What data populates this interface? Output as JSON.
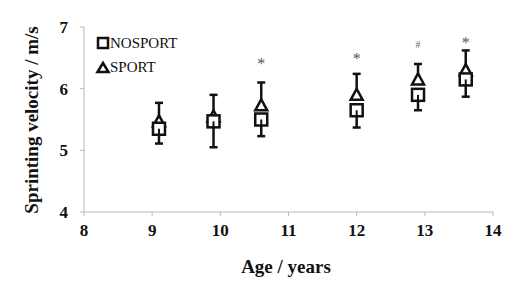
{
  "chart_data": {
    "type": "scatter",
    "title": "",
    "xlabel": "Age / years",
    "ylabel": "Sprinting velocity / m/s",
    "xlim": [
      8,
      14
    ],
    "ylim": [
      4,
      7
    ],
    "xticks": [
      8,
      9,
      10,
      11,
      12,
      13,
      14
    ],
    "yticks": [
      4,
      5,
      6,
      7
    ],
    "grid": false,
    "legend_position": "upper-left",
    "series": [
      {
        "name": "NOSPORT",
        "marker": "square",
        "x": [
          9.1,
          9.9,
          10.6,
          12.0,
          12.9,
          13.6
        ],
        "y": [
          5.35,
          5.47,
          5.5,
          5.65,
          5.9,
          6.15
        ],
        "err_low": [
          5.11,
          5.05,
          5.23,
          5.37,
          5.65,
          5.87
        ]
      },
      {
        "name": "SPORT",
        "marker": "triangle",
        "x": [
          9.1,
          9.9,
          10.6,
          12.0,
          12.9,
          13.6
        ],
        "y": [
          5.47,
          5.55,
          5.73,
          5.9,
          6.15,
          6.3
        ],
        "err_high": [
          5.77,
          5.9,
          6.1,
          6.24,
          6.4,
          6.62
        ]
      }
    ],
    "annotations": [
      {
        "text": "*",
        "x": 10.6,
        "y": 6.42
      },
      {
        "text": "*",
        "x": 12.0,
        "y": 6.5
      },
      {
        "text": "#",
        "x": 12.9,
        "y": 6.75
      },
      {
        "text": "*",
        "x": 13.6,
        "y": 6.75
      }
    ]
  },
  "legend": {
    "items": [
      {
        "label": "NOSPORT",
        "marker": "square"
      },
      {
        "label": "SPORT",
        "marker": "triangle"
      }
    ]
  },
  "axes": {
    "x_title": "Age / years",
    "y_title": "Sprinting velocity / m/s",
    "x_tick_labels": [
      "8",
      "9",
      "10",
      "11",
      "12",
      "13",
      "14"
    ],
    "y_tick_labels": [
      "4",
      "5",
      "6",
      "7"
    ]
  },
  "colors": {
    "axis": "#bbbbbb",
    "marker": "#111111",
    "annotation": "#555555"
  }
}
